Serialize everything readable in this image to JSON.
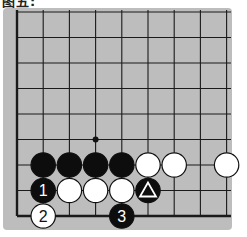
{
  "caption": "图五:",
  "board": {
    "background": "#bdbdbd",
    "line_color": "#1a1a1a",
    "cols": 9,
    "rows": 9,
    "origin_x": 17,
    "origin_y": 12,
    "step_x": 26.2,
    "step_y": 25.5,
    "left_edge": true,
    "bottom_edge": true,
    "star_points": [
      {
        "col": 3,
        "row": 5
      }
    ],
    "stones": [
      {
        "col": 1,
        "row": 6,
        "color": "black",
        "label": ""
      },
      {
        "col": 2,
        "row": 6,
        "color": "black",
        "label": ""
      },
      {
        "col": 3,
        "row": 6,
        "color": "black",
        "label": ""
      },
      {
        "col": 4,
        "row": 6,
        "color": "black",
        "label": ""
      },
      {
        "col": 5,
        "row": 6,
        "color": "white",
        "label": ""
      },
      {
        "col": 6,
        "row": 6,
        "color": "white",
        "label": ""
      },
      {
        "col": 8,
        "row": 6,
        "color": "white",
        "label": ""
      },
      {
        "col": 1,
        "row": 7,
        "color": "black",
        "label": "1"
      },
      {
        "col": 2,
        "row": 7,
        "color": "white",
        "label": ""
      },
      {
        "col": 3,
        "row": 7,
        "color": "white",
        "label": ""
      },
      {
        "col": 4,
        "row": 7,
        "color": "white",
        "label": ""
      },
      {
        "col": 5,
        "row": 7,
        "color": "black",
        "label": "",
        "marker": "triangle"
      },
      {
        "col": 1,
        "row": 8,
        "color": "white",
        "label": "2"
      },
      {
        "col": 4,
        "row": 8,
        "color": "black",
        "label": "3"
      }
    ]
  }
}
